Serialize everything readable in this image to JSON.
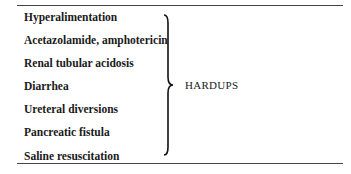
{
  "table": {
    "causes": [
      "Hyperalimentation",
      "Acetazolamide, amphotericin",
      "Renal tubular acidosis",
      "Diarrhea",
      "Ureteral diversions",
      "Pancreatic fistula",
      "Saline resuscitation"
    ],
    "mnemonic": "HARDUPS"
  }
}
